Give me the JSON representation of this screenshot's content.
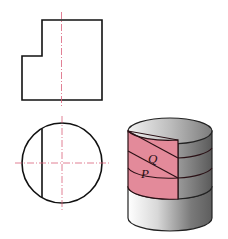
{
  "figure": {
    "front_view": {
      "title": "front-view",
      "outline_color": "#111111",
      "centerline_color": "#d9607a"
    },
    "top_view": {
      "title": "top-view",
      "outline_color": "#111111",
      "centerline_color": "#d9607a"
    },
    "iso_view": {
      "title": "isometric-view",
      "face_color": "#e38a9a",
      "labels": {
        "q": "Q",
        "p": "P"
      }
    }
  }
}
